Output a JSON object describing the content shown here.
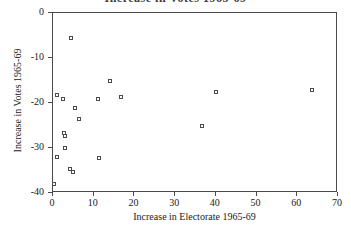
{
  "chart_data": {
    "type": "scatter",
    "title": "Increase in Votes 1965-69",
    "xlabel": "Increase in Electorate 1965-69",
    "ylabel": "Increase in Votes 1965-69",
    "xlim": [
      0,
      70
    ],
    "ylim": [
      -40,
      0
    ],
    "xticks": [
      0,
      10,
      20,
      30,
      40,
      50,
      60,
      70
    ],
    "yticks": [
      0,
      -10,
      -20,
      -30,
      -40
    ],
    "xticklabels": [
      "0",
      "10",
      "20",
      "30",
      "40",
      "50",
      "60",
      "70"
    ],
    "yticklabels": [
      "0",
      "-10",
      "-20",
      "-30",
      "-40"
    ],
    "grid": false,
    "legend": null,
    "marker": "open-square",
    "marker_edge_color": "#4b4b4b",
    "marker_face_color": "#ffffff",
    "frame_color": "#4a4a4a",
    "background_color": "#ffffff",
    "points": [
      {
        "x": 4.3,
        "y": -5.5
      },
      {
        "x": 14.0,
        "y": -15.1
      },
      {
        "x": 63.5,
        "y": -17.0
      },
      {
        "x": 40.0,
        "y": -17.5
      },
      {
        "x": 1.0,
        "y": -18.2
      },
      {
        "x": 16.6,
        "y": -18.6
      },
      {
        "x": 2.5,
        "y": -19.1
      },
      {
        "x": 11.0,
        "y": -19.2
      },
      {
        "x": 5.3,
        "y": -21.1
      },
      {
        "x": 6.5,
        "y": -23.5
      },
      {
        "x": 36.5,
        "y": -25.0
      },
      {
        "x": 2.8,
        "y": -26.7
      },
      {
        "x": 2.9,
        "y": -27.4
      },
      {
        "x": 3.0,
        "y": -30.1
      },
      {
        "x": 0.9,
        "y": -32.0
      },
      {
        "x": 11.3,
        "y": -32.3
      },
      {
        "x": 4.2,
        "y": -34.6
      },
      {
        "x": 4.9,
        "y": -35.3
      },
      {
        "x": 0.2,
        "y": -38.1
      }
    ]
  }
}
